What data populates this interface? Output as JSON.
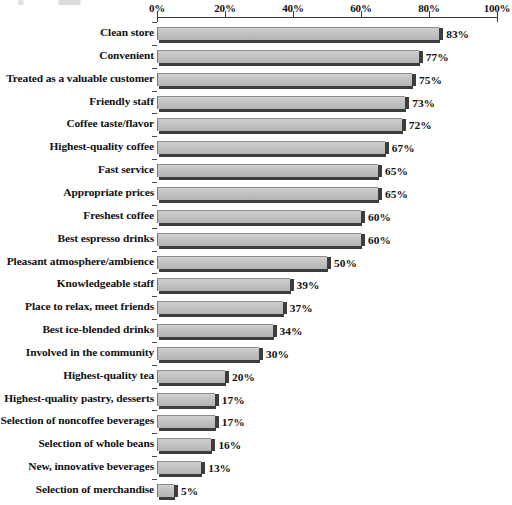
{
  "chart_data": {
    "type": "bar",
    "orientation": "horizontal",
    "title": "",
    "subtitle": "",
    "xlabel": "",
    "ylabel": "",
    "xlim": [
      0,
      100
    ],
    "grid": false,
    "legend": null,
    "value_suffix": "%",
    "axis_position": "top",
    "tick_labels": [
      "0%",
      "20%",
      "40%",
      "60%",
      "80%",
      "100%"
    ],
    "tick_values": [
      0,
      20,
      40,
      60,
      80,
      100
    ],
    "categories": [
      "Clean store",
      "Convenient",
      "Treated as a valuable customer",
      "Friendly staff",
      "Coffee taste/flavor",
      "Highest-quality coffee",
      "Fast service",
      "Appropriate prices",
      "Freshest coffee",
      "Best espresso drinks",
      "Pleasant atmosphere/ambience",
      "Knowledgeable staff",
      "Place to relax, meet friends",
      "Best ice-blended drinks",
      "Involved in the community",
      "Highest-quality tea",
      "Highest-quality pastry, desserts",
      "Selection of noncoffee beverages",
      "Selection of whole beans",
      "New, innovative beverages",
      "Selection of merchandise"
    ],
    "values": [
      83,
      77,
      75,
      73,
      72,
      67,
      65,
      65,
      60,
      60,
      50,
      39,
      37,
      34,
      30,
      20,
      17,
      17,
      16,
      13,
      5
    ],
    "data_labels": [
      "83%",
      "77%",
      "75%",
      "73%",
      "72%",
      "67%",
      "65%",
      "65%",
      "60%",
      "60%",
      "50%",
      "39%",
      "37%",
      "34%",
      "30%",
      "20%",
      "17%",
      "17%",
      "16%",
      "13%",
      "5%"
    ],
    "colors": {
      "bar_fill": "#c4c4c4",
      "bar_edge": "#3d3d3d",
      "axis": "#3a3a3a",
      "text": "#101010",
      "background": "#ffffff"
    }
  }
}
